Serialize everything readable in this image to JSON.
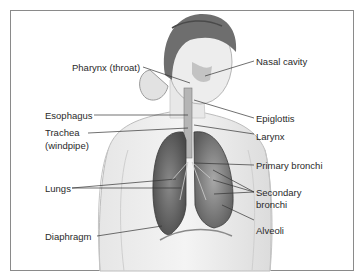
{
  "figure": {
    "labels_left": [
      {
        "id": "pharynx",
        "text": "Pharynx (throat)"
      },
      {
        "id": "esophagus",
        "text": "Esophagus"
      },
      {
        "id": "trachea",
        "text": "Trachea",
        "sub": "(windpipe)"
      },
      {
        "id": "lungs",
        "text": "Lungs"
      },
      {
        "id": "diaphragm",
        "text": "Diaphragm"
      }
    ],
    "labels_right": [
      {
        "id": "nasal",
        "text": "Nasal cavity"
      },
      {
        "id": "epiglottis",
        "text": "Epiglottis"
      },
      {
        "id": "larynx",
        "text": "Larynx"
      },
      {
        "id": "primary",
        "text": "Primary bronchi"
      },
      {
        "id": "secondary",
        "text": "Secondary",
        "sub": "bronchi"
      },
      {
        "id": "alveoli",
        "text": "Alveoli"
      }
    ],
    "colors": {
      "frame": "#8a8a8a",
      "text": "#2a2a2a",
      "leader": "#333333"
    }
  }
}
